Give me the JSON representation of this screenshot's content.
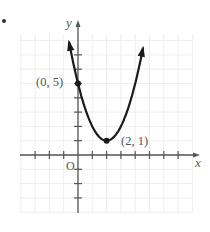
{
  "problem_marker": "•",
  "chart_data": {
    "type": "line",
    "title": "",
    "equation": "y = (x - 2)^2 + 1",
    "xlabel": "x",
    "ylabel": "y",
    "origin_label": "O",
    "xlim": [
      -4,
      8.5
    ],
    "ylim": [
      -4,
      9
    ],
    "grid": true,
    "x_ticks": [
      -3,
      -2,
      -1,
      1,
      2,
      3,
      4,
      5,
      6,
      7
    ],
    "y_ticks": [
      -3,
      -2,
      -1,
      1,
      2,
      3,
      4,
      5,
      6,
      7
    ],
    "series": [
      {
        "name": "parabola",
        "x": [
          -0.63,
          0,
          0.5,
          1,
          1.5,
          2,
          2.5,
          3,
          3.5,
          4,
          4.55
        ],
        "y": [
          7.92,
          5,
          3.25,
          2,
          1.25,
          1,
          1.25,
          2,
          3.25,
          5,
          7.5
        ],
        "arrows": "both-ends"
      }
    ],
    "points": [
      {
        "x": 0,
        "y": 5,
        "label": "(0, 5)"
      },
      {
        "x": 2,
        "y": 1,
        "label": "(2, 1)"
      }
    ],
    "colors": {
      "curve": "#1a1a1a",
      "axes": "#555555",
      "grid": "#eeeeee",
      "labels": "#555555"
    }
  }
}
